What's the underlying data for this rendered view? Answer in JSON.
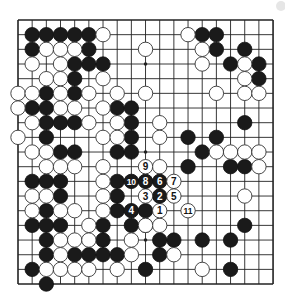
{
  "diagram": {
    "type": "go-board",
    "size": 19,
    "colors": {
      "background": "#ffffff",
      "line": "#222222",
      "black": "#1a1a1a",
      "white": "#ffffff",
      "star": "#222222"
    },
    "geometry": {
      "x0": 18,
      "y0": 20,
      "dx": 14.17,
      "dy": 14.67,
      "stone_radius": 7.2
    },
    "star_points": [
      [
        3,
        3
      ],
      [
        3,
        9
      ],
      [
        3,
        15
      ],
      [
        9,
        3
      ],
      [
        9,
        9
      ],
      [
        9,
        15
      ],
      [
        15,
        3
      ],
      [
        15,
        9
      ],
      [
        15,
        15
      ]
    ],
    "stones": {
      "black": [
        [
          1,
          1
        ],
        [
          2,
          1
        ],
        [
          3,
          1
        ],
        [
          4,
          1
        ],
        [
          5,
          1
        ],
        [
          1,
          2
        ],
        [
          5,
          2
        ],
        [
          4,
          3
        ],
        [
          5,
          3
        ],
        [
          6,
          3
        ],
        [
          4,
          4
        ],
        [
          2,
          5
        ],
        [
          4,
          5
        ],
        [
          1,
          6
        ],
        [
          2,
          6
        ],
        [
          7,
          6
        ],
        [
          8,
          6
        ],
        [
          2,
          7
        ],
        [
          3,
          7
        ],
        [
          4,
          7
        ],
        [
          8,
          7
        ],
        [
          2,
          8
        ],
        [
          8,
          8
        ],
        [
          3,
          9
        ],
        [
          4,
          9
        ],
        [
          7,
          9
        ],
        [
          8,
          9
        ],
        [
          1,
          11
        ],
        [
          2,
          11
        ],
        [
          3,
          11
        ],
        [
          7,
          11
        ],
        [
          3,
          12
        ],
        [
          7,
          12
        ],
        [
          2,
          13
        ],
        [
          7,
          13
        ],
        [
          9,
          13
        ],
        [
          1,
          14
        ],
        [
          2,
          14
        ],
        [
          3,
          14
        ],
        [
          6,
          14
        ],
        [
          8,
          14
        ],
        [
          2,
          15
        ],
        [
          6,
          15
        ],
        [
          10,
          15
        ],
        [
          11,
          15
        ],
        [
          2,
          16
        ],
        [
          4,
          16
        ],
        [
          5,
          16
        ],
        [
          6,
          16
        ],
        [
          7,
          16
        ],
        [
          10,
          16
        ],
        [
          1,
          17
        ],
        [
          9,
          17
        ],
        [
          2,
          18
        ],
        [
          13,
          1
        ],
        [
          14,
          1
        ],
        [
          14,
          2
        ],
        [
          16,
          2
        ],
        [
          15,
          3
        ],
        [
          17,
          3
        ],
        [
          17,
          4
        ],
        [
          16,
          7
        ],
        [
          12,
          8
        ],
        [
          14,
          8
        ],
        [
          13,
          9
        ],
        [
          12,
          10
        ],
        [
          15,
          10
        ],
        [
          16,
          10
        ],
        [
          16,
          14
        ],
        [
          13,
          15
        ],
        [
          15,
          15
        ],
        [
          15,
          17
        ]
      ],
      "white": [
        [
          6,
          1
        ],
        [
          2,
          2
        ],
        [
          3,
          2
        ],
        [
          4,
          2
        ],
        [
          1,
          3
        ],
        [
          3,
          3
        ],
        [
          2,
          4
        ],
        [
          3,
          4
        ],
        [
          6,
          4
        ],
        [
          0,
          5
        ],
        [
          1,
          5
        ],
        [
          3,
          5
        ],
        [
          5,
          5
        ],
        [
          7,
          5
        ],
        [
          9,
          5
        ],
        [
          0,
          6
        ],
        [
          3,
          6
        ],
        [
          4,
          6
        ],
        [
          6,
          6
        ],
        [
          1,
          7
        ],
        [
          5,
          7
        ],
        [
          7,
          7
        ],
        [
          0,
          8
        ],
        [
          6,
          8
        ],
        [
          7,
          8
        ],
        [
          1,
          9
        ],
        [
          2,
          9
        ],
        [
          2,
          10
        ],
        [
          3,
          10
        ],
        [
          4,
          10
        ],
        [
          6,
          10
        ],
        [
          6,
          11
        ],
        [
          1,
          12
        ],
        [
          2,
          12
        ],
        [
          6,
          12
        ],
        [
          1,
          13
        ],
        [
          3,
          13
        ],
        [
          4,
          13
        ],
        [
          6,
          13
        ],
        [
          5,
          14
        ],
        [
          9,
          14
        ],
        [
          10,
          14
        ],
        [
          3,
          15
        ],
        [
          4,
          15
        ],
        [
          5,
          15
        ],
        [
          8,
          15
        ],
        [
          3,
          16
        ],
        [
          8,
          16
        ],
        [
          11,
          16
        ],
        [
          2,
          17
        ],
        [
          3,
          17
        ],
        [
          4,
          17
        ],
        [
          5,
          17
        ],
        [
          7,
          17
        ],
        [
          13,
          17
        ],
        [
          12,
          1
        ],
        [
          9,
          2
        ],
        [
          13,
          2
        ],
        [
          13,
          3
        ],
        [
          16,
          3
        ],
        [
          16,
          4
        ],
        [
          14,
          5
        ],
        [
          16,
          5
        ],
        [
          17,
          5
        ],
        [
          10,
          7
        ],
        [
          10,
          8
        ],
        [
          14,
          9
        ],
        [
          15,
          9
        ],
        [
          16,
          9
        ],
        [
          17,
          9
        ],
        [
          10,
          10
        ],
        [
          17,
          10
        ],
        [
          16,
          12
        ],
        [
          9,
          14
        ]
      ]
    },
    "numbered_moves": [
      {
        "n": "1",
        "color": "white",
        "x": 10,
        "y": 13
      },
      {
        "n": "2",
        "color": "black",
        "x": 10,
        "y": 12
      },
      {
        "n": "3",
        "color": "white",
        "x": 9,
        "y": 12
      },
      {
        "n": "4",
        "color": "black",
        "x": 8,
        "y": 13
      },
      {
        "n": "5",
        "color": "white",
        "x": 11,
        "y": 12
      },
      {
        "n": "6",
        "color": "black",
        "x": 10,
        "y": 11
      },
      {
        "n": "7",
        "color": "white",
        "x": 11,
        "y": 11
      },
      {
        "n": "8",
        "color": "black",
        "x": 9,
        "y": 11
      },
      {
        "n": "9",
        "color": "white",
        "x": 9,
        "y": 10
      },
      {
        "n": "10",
        "color": "black",
        "x": 8,
        "y": 11
      },
      {
        "n": "11",
        "color": "white",
        "x": 12,
        "y": 13
      }
    ]
  }
}
